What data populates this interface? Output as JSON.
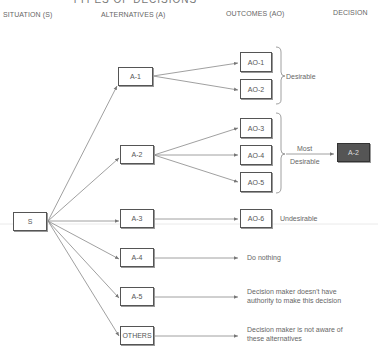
{
  "title": "TYPES OF DECISIONS",
  "headers": {
    "situation": "SITUATION (S)",
    "alternatives": "ALTERNATIVES (A)",
    "outcomes": "OUTCOMES (AO)",
    "decision": "DECISION"
  },
  "situation": {
    "label": "S"
  },
  "alternatives": [
    {
      "id": "A-1",
      "label": "A-1"
    },
    {
      "id": "A-2",
      "label": "A-2"
    },
    {
      "id": "A-3",
      "label": "A-3"
    },
    {
      "id": "A-4",
      "label": "A-4"
    },
    {
      "id": "A-5",
      "label": "A-5"
    },
    {
      "id": "OTHERS",
      "label": "OTHERS"
    }
  ],
  "outcomes": [
    {
      "id": "AO-1",
      "label": "AO-1"
    },
    {
      "id": "AO-2",
      "label": "AO-2"
    },
    {
      "id": "AO-3",
      "label": "AO-3"
    },
    {
      "id": "AO-4",
      "label": "AO-4"
    },
    {
      "id": "AO-5",
      "label": "AO-5"
    },
    {
      "id": "AO-6",
      "label": "AO-6"
    }
  ],
  "decision": {
    "label": "A-2",
    "fill": "#555555"
  },
  "annotations": {
    "desirable": "Desirable",
    "most_desirable_line1": "Most",
    "most_desirable_line2": "Desirable",
    "undesirable": "Undesirable",
    "do_nothing": "Do nothing",
    "no_authority_line1": "Decision maker doesn't have",
    "no_authority_line2": "authority to make this decision",
    "not_aware_line1": "Decision maker is not aware of",
    "not_aware_line2": "these alternatives"
  }
}
